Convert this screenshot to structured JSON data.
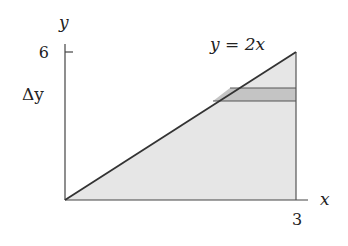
{
  "diagram": {
    "axes": {
      "x_label": "x",
      "y_label": "y",
      "x_tick": "3",
      "y_tick": "6"
    },
    "curve_label": "y = 2x",
    "strip_label": "Δy",
    "region": {
      "description": "Triangle bounded by y = 2x, x = 3 and y = 0",
      "fill_color": "#e6e6e6",
      "strip_color": "#c4c4c4",
      "line_color": "#333333"
    }
  }
}
